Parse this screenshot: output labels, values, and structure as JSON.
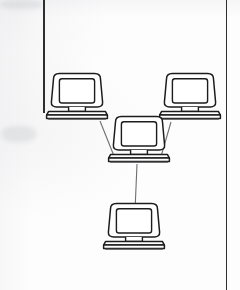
{
  "page": {
    "kind": "scanned-document-page",
    "background_color": "#fdfdfd",
    "width": 240,
    "height": 290
  },
  "scan_artifacts": {
    "left_rule": {
      "x": 43,
      "y_top": 0,
      "y_bottom": 113,
      "thickness": 1.6,
      "color": "#2e2e2e"
    },
    "right_rule": {
      "x": 226,
      "y_top": 0,
      "y_bottom": 290,
      "thickness": 1.4,
      "color": "#2e2e2e"
    },
    "smudges": [
      {
        "x": 0,
        "y": 0,
        "w": 42,
        "h": 9
      },
      {
        "x": 2,
        "y": 126,
        "w": 34,
        "h": 16
      }
    ]
  },
  "diagram": {
    "type": "network-topology",
    "stroke_color": "#1c1c1c",
    "fill_color": "#ffffff",
    "link_color": "#6e6e74",
    "nodes": [
      {
        "id": "computer-top-left",
        "label": "Computer (top left)",
        "icon": "desktop-computer-icon",
        "x": 77,
        "y": 100,
        "scale": 1.0
      },
      {
        "id": "computer-top-right",
        "label": "Computer (top right)",
        "icon": "desktop-computer-icon",
        "x": 190,
        "y": 100,
        "scale": 1.0
      },
      {
        "id": "computer-center",
        "label": "Computer (center hub)",
        "icon": "desktop-computer-icon",
        "x": 139,
        "y": 143,
        "scale": 1.0
      },
      {
        "id": "computer-bottom",
        "label": "Computer (bottom)",
        "icon": "desktop-computer-icon",
        "x": 134,
        "y": 230,
        "scale": 1.0
      }
    ],
    "links": [
      {
        "id": "link-topleft-center",
        "from": "computer-top-left",
        "to": "computer-center",
        "x1": 100,
        "y1": 121,
        "x2": 116,
        "y2": 161
      },
      {
        "id": "link-topright-center",
        "from": "computer-top-right",
        "to": "computer-center",
        "x1": 171,
        "y1": 122,
        "x2": 160,
        "y2": 160
      },
      {
        "id": "link-center-bottom",
        "from": "computer-center",
        "to": "computer-bottom",
        "x1": 137,
        "y1": 164,
        "x2": 135,
        "y2": 211
      }
    ]
  }
}
